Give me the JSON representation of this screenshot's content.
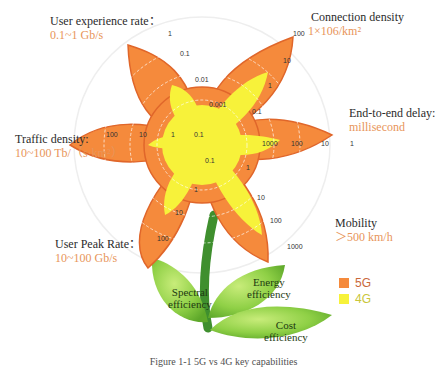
{
  "diagram": {
    "petals": [
      {
        "id": "user-experience-rate",
        "label": "User experience rate：",
        "value": "0.1~1 Gb/s",
        "ticks": [
          "1",
          "0.1",
          "0.01",
          "0.001"
        ]
      },
      {
        "id": "connection-density",
        "label": "Connection density",
        "value": "1×106/km²",
        "ticks": [
          "100",
          "10",
          "1",
          "0.1"
        ]
      },
      {
        "id": "end-to-end-delay",
        "label": "End-to-end delay:",
        "value": "millisecond",
        "ticks": [
          "1",
          "10",
          "100",
          "1000"
        ]
      },
      {
        "id": "mobility",
        "label": "Mobility",
        "value": "＞500 km/h",
        "ticks": [
          "1000",
          "100",
          "10",
          "1"
        ]
      },
      {
        "id": "user-peak-rate",
        "label": "User Peak Rate：",
        "value": "10~100 Gb/s",
        "ticks": [
          "100",
          "10",
          "1",
          "0.1"
        ]
      },
      {
        "id": "traffic-density",
        "label": "Traffic density:",
        "value": "10~100 Tb/（s·km²）",
        "ticks": [
          "100",
          "10",
          "1",
          "0.1"
        ]
      }
    ],
    "leaves": [
      {
        "id": "spectral-efficiency",
        "label_line1": "Spectral",
        "label_line2": "efficiency"
      },
      {
        "id": "energy-efficiency",
        "label_line1": "Energy",
        "label_line2": "efficiency"
      },
      {
        "id": "cost-efficiency",
        "label_line1": "Cost",
        "label_line2": "efficiency"
      }
    ],
    "legend": [
      {
        "label": "5G",
        "color": "#f58a3c"
      },
      {
        "label": "4G",
        "color": "#f7f23a"
      }
    ],
    "caption": "Figure 1-1  5G vs 4G key capabilities"
  },
  "colors": {
    "petal_5g": "#f58a3c",
    "petal_5g_edge": "#e0662a",
    "petal_4g": "#f7f23a",
    "label_value": "#e8955a",
    "stem": "#3f8f2e",
    "leaf": "#8fd046"
  }
}
